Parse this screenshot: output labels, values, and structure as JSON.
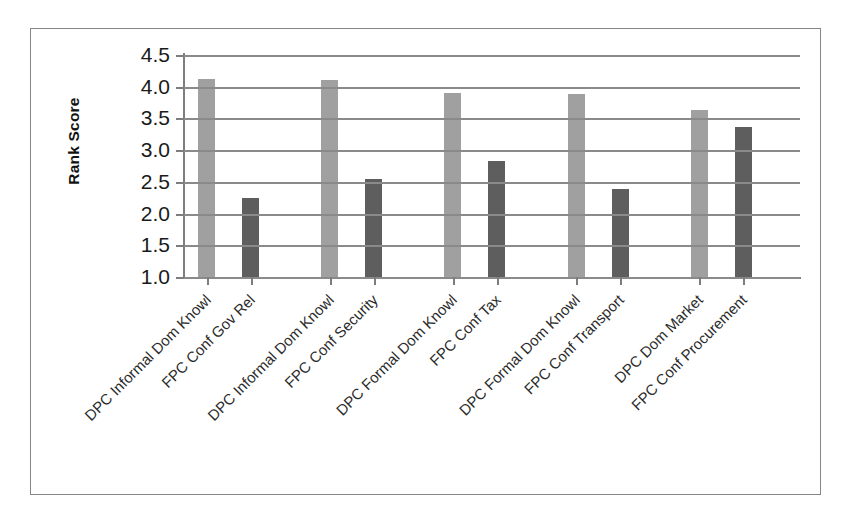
{
  "chart_data": {
    "type": "bar",
    "title": "",
    "subtitle": "",
    "xlabel": "",
    "ylabel": "Rank Score",
    "ylim": [
      1.0,
      4.5
    ],
    "yticks": [
      "1.0",
      "1.5",
      "2.0",
      "2.5",
      "3.0",
      "3.5",
      "4.0",
      "4.5"
    ],
    "grid": true,
    "legend": "none",
    "categories": [
      "DPC Informal Dom Knowl",
      "FPC Conf Gov Rel",
      "DPC Informal Dom Knowl",
      "FPC Conf Security",
      "DPC Formal Dom Knowl",
      "FPC Conf Tax",
      "DPC Formal Dom Knowl",
      "FPC Conf Transport",
      "DPC Dom Market",
      "FPC Conf Procurement"
    ],
    "values": [
      4.12,
      2.24,
      4.11,
      2.55,
      3.9,
      2.83,
      3.88,
      2.38,
      3.63,
      3.36
    ],
    "bar_styles": [
      "light",
      "dark",
      "light",
      "dark",
      "light",
      "dark",
      "light",
      "dark",
      "light",
      "dark"
    ],
    "colors": {
      "light_bar": "#a0a0a0",
      "dark_bar": "#5e5e5e",
      "gridline": "#8a8a8a",
      "axis": "#7d7d7d",
      "frame": "#868686",
      "text": "#1a1a1a",
      "background": "#ffffff"
    }
  }
}
